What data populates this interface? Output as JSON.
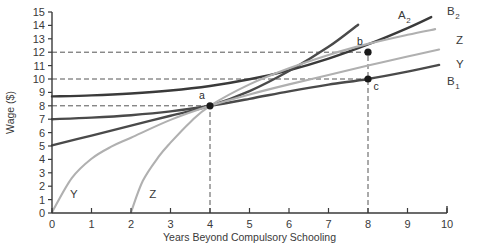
{
  "chart_data": {
    "type": "line",
    "title": "",
    "xlabel": "Years Beyond Compulsory Schooling",
    "ylabel": "Wage ($)",
    "xlim": [
      0,
      10
    ],
    "ylim": [
      0,
      15
    ],
    "xticks": [
      "0",
      "1",
      "2",
      "3",
      "4",
      "5",
      "6",
      "7",
      "8",
      "9",
      "10"
    ],
    "yticks": [
      "0",
      "1",
      "2",
      "3",
      "4",
      "5",
      "6",
      "7",
      "8",
      "9",
      "10",
      "11",
      "12",
      "13",
      "14",
      "15"
    ],
    "grid": false,
    "legend_position": "curve-end-labels",
    "series": [
      {
        "name": "B2",
        "label": "B",
        "sublabel": "2",
        "color": "#3a3a3a",
        "style": "solid-dark",
        "points": [
          {
            "x": 0.0,
            "y": 8.7
          },
          {
            "x": 1.0,
            "y": 8.78
          },
          {
            "x": 2.0,
            "y": 8.92
          },
          {
            "x": 3.0,
            "y": 9.14
          },
          {
            "x": 4.0,
            "y": 9.48
          },
          {
            "x": 5.0,
            "y": 9.98
          },
          {
            "x": 6.0,
            "y": 10.65
          },
          {
            "x": 7.0,
            "y": 11.52
          },
          {
            "x": 8.0,
            "y": 12.58
          },
          {
            "x": 9.0,
            "y": 13.8
          },
          {
            "x": 9.6,
            "y": 14.62
          }
        ]
      },
      {
        "name": "B1",
        "label": "B",
        "sublabel": "1",
        "color": "#4a4a4a",
        "style": "solid-dark",
        "points": [
          {
            "x": 0.0,
            "y": 7.0
          },
          {
            "x": 1.0,
            "y": 7.12
          },
          {
            "x": 2.0,
            "y": 7.3
          },
          {
            "x": 3.0,
            "y": 7.58
          },
          {
            "x": 4.0,
            "y": 8.0
          },
          {
            "x": 5.0,
            "y": 8.52
          },
          {
            "x": 6.0,
            "y": 9.08
          },
          {
            "x": 7.0,
            "y": 9.58
          },
          {
            "x": 8.0,
            "y": 10.0
          },
          {
            "x": 9.0,
            "y": 10.55
          },
          {
            "x": 9.8,
            "y": 11.05
          }
        ]
      },
      {
        "name": "A2",
        "label": "A",
        "sublabel": "2",
        "color": "#4a4a4a",
        "style": "solid-dark",
        "points": [
          {
            "x": 0.0,
            "y": 5.05
          },
          {
            "x": 1.0,
            "y": 5.78
          },
          {
            "x": 2.0,
            "y": 6.52
          },
          {
            "x": 3.0,
            "y": 7.26
          },
          {
            "x": 4.0,
            "y": 8.0
          },
          {
            "x": 5.0,
            "y": 9.1
          },
          {
            "x": 6.0,
            "y": 10.6
          },
          {
            "x": 7.0,
            "y": 12.4
          },
          {
            "x": 7.75,
            "y": 14.05
          }
        ]
      },
      {
        "name": "Y",
        "label": "Y",
        "sublabel": "",
        "color": "#b0b0b0",
        "style": "solid-light",
        "points": [
          {
            "x": 0.0,
            "y": 0.05
          },
          {
            "x": 0.5,
            "y": 2.6
          },
          {
            "x": 1.0,
            "y": 4.05
          },
          {
            "x": 1.5,
            "y": 4.95
          },
          {
            "x": 2.0,
            "y": 5.62
          },
          {
            "x": 3.0,
            "y": 6.95
          },
          {
            "x": 4.0,
            "y": 8.0
          },
          {
            "x": 5.0,
            "y": 8.85
          },
          {
            "x": 6.0,
            "y": 9.6
          },
          {
            "x": 7.0,
            "y": 10.3
          },
          {
            "x": 8.0,
            "y": 11.0
          },
          {
            "x": 9.0,
            "y": 11.68
          },
          {
            "x": 9.8,
            "y": 12.2
          }
        ]
      },
      {
        "name": "Z",
        "label": "Z",
        "sublabel": "",
        "color": "#b0b0b0",
        "style": "solid-light",
        "points": [
          {
            "x": 2.0,
            "y": 0.05
          },
          {
            "x": 2.3,
            "y": 2.4
          },
          {
            "x": 2.7,
            "y": 4.2
          },
          {
            "x": 3.0,
            "y": 5.25
          },
          {
            "x": 3.5,
            "y": 6.78
          },
          {
            "x": 4.0,
            "y": 8.0
          },
          {
            "x": 5.0,
            "y": 9.6
          },
          {
            "x": 6.0,
            "y": 10.8
          },
          {
            "x": 7.0,
            "y": 11.8
          },
          {
            "x": 8.0,
            "y": 12.62
          },
          {
            "x": 9.0,
            "y": 13.3
          },
          {
            "x": 9.7,
            "y": 13.72
          }
        ]
      }
    ],
    "points_of_interest": [
      {
        "id": "a",
        "x": 4,
        "y": 8,
        "label": "a",
        "label_pos": "above-left"
      },
      {
        "id": "b",
        "x": 8,
        "y": 12,
        "label": "b",
        "label_pos": "above-left"
      },
      {
        "id": "c",
        "x": 8,
        "y": 10,
        "label": "c",
        "label_pos": "below-right"
      }
    ],
    "guide_lines": [
      {
        "type": "horizontal",
        "value": 12,
        "from_x": 0,
        "to_x": 8
      },
      {
        "type": "horizontal",
        "value": 10,
        "from_x": 0,
        "to_x": 8
      },
      {
        "type": "horizontal",
        "value": 8,
        "from_x": 0,
        "to_x": 4
      },
      {
        "type": "vertical",
        "value": 4,
        "from_y": 0,
        "to_y": 8
      },
      {
        "type": "vertical",
        "value": 8,
        "from_y": 0,
        "to_y": 12
      }
    ],
    "inline_labels": [
      {
        "text": "Y",
        "x": 0.55,
        "y": 1.15,
        "name": "curve-start-label-Y"
      },
      {
        "text": "Z",
        "x": 2.55,
        "y": 1.15,
        "name": "curve-start-label-Z"
      }
    ],
    "end_labels": [
      {
        "text": "A",
        "sub": "2",
        "px": 398,
        "py": 19,
        "name": "curve-end-label-A2"
      },
      {
        "text": "B",
        "sub": "2",
        "px": 447,
        "py": 15,
        "name": "curve-end-label-B2"
      },
      {
        "text": "Z",
        "sub": "",
        "px": 456,
        "py": 44,
        "name": "curve-end-label-Z"
      },
      {
        "text": "Y",
        "sub": "",
        "px": 456,
        "py": 68,
        "name": "curve-end-label-Y"
      },
      {
        "text": "B",
        "sub": "1",
        "px": 447,
        "py": 85,
        "name": "curve-end-label-B1"
      }
    ],
    "colors": {
      "axis": "#3a3a3a",
      "dark_curve": "#4a4a4a",
      "light_curve": "#b0b0b0",
      "dashed_guide": "#555555",
      "marker": "#1a1a1a",
      "background": "#ffffff"
    }
  }
}
